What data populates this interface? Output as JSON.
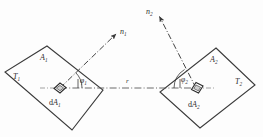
{
  "figure": {
    "type": "diagram",
    "background_color": "#fdfdfd",
    "line_color": "#3a3a3a",
    "text_color": "#2b2b2b",
    "width": 263,
    "height": 137
  },
  "surface_1": {
    "area_label": "A",
    "area_sub": "1",
    "temperature_label": "T",
    "temperature_sub": "1",
    "element_label": "d",
    "element_area": "A",
    "element_sub": "1",
    "normal_label": "n",
    "normal_sub": "1",
    "angle_label": "φ",
    "angle_sub": "1",
    "plate_points": "47,46 103,90 72,130 5,72",
    "element_center_x": 60,
    "element_center_y": 88
  },
  "surface_2": {
    "area_label": "A",
    "area_sub": "2",
    "temperature_label": "T",
    "temperature_sub": "2",
    "element_label": "d",
    "element_area": "A",
    "element_sub": "2",
    "normal_label": "n",
    "normal_sub": "2",
    "angle_label": "φ",
    "angle_sub": "2",
    "plate_points": "216,48 255,85 200,128 160,92",
    "element_center_x": 196,
    "element_center_y": 88
  },
  "connector": {
    "distance_label": "r",
    "from_x": 60,
    "from_y": 88,
    "to_x": 196,
    "to_y": 88
  },
  "normals": {
    "n1_tip_x": 118,
    "n1_tip_y": 32,
    "n2_tip_x": 158,
    "n2_tip_y": 14
  }
}
